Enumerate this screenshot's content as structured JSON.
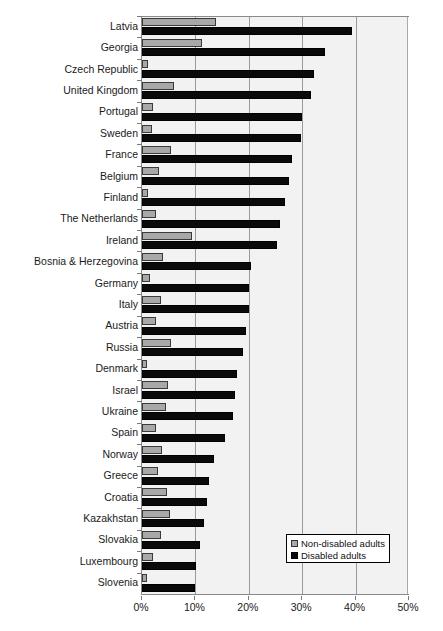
{
  "chart_data": {
    "type": "bar",
    "orientation": "horizontal",
    "title": "",
    "subtitle": "",
    "xlabel": "",
    "ylabel": "",
    "xlim": [
      0,
      50
    ],
    "xunit": "%",
    "xtick_labels": [
      "0%",
      "10%",
      "20%",
      "30%",
      "40%",
      "50%"
    ],
    "xticks": [
      0,
      10,
      20,
      30,
      40,
      50
    ],
    "grid": true,
    "grid_axis": "x",
    "legend_position": "bottom-right",
    "categories": [
      "Latvia",
      "Georgia",
      "Czech Republic",
      "United Kingdom",
      "Portugal",
      "Sweden",
      "France",
      "Belgium",
      "Finland",
      "The Netherlands",
      "Ireland",
      "Bosnia & Herzegovina",
      "Germany",
      "Italy",
      "Austria",
      "Russia",
      "Denmark",
      "Israel",
      "Ukraine",
      "Spain",
      "Norway",
      "Greece",
      "Croatia",
      "Kazakhstan",
      "Slovakia",
      "Luxembourg",
      "Slovenia"
    ],
    "series": [
      {
        "name": "Non-disabled adults",
        "color": "#a8a8a8",
        "values": [
          13.9,
          11.2,
          1.1,
          6.0,
          2.1,
          1.8,
          5.4,
          3.2,
          1.2,
          2.6,
          9.4,
          4.0,
          1.5,
          3.6,
          2.6,
          5.5,
          0.9,
          4.9,
          4.5,
          2.6,
          3.8,
          3.0,
          4.6,
          5.2,
          3.6,
          2.0,
          1.0
        ]
      },
      {
        "name": "Disabled adults",
        "color": "#0a0a0a",
        "values": [
          39.3,
          34.2,
          32.2,
          31.7,
          29.9,
          29.7,
          28.0,
          27.5,
          26.7,
          25.8,
          25.2,
          20.4,
          20.0,
          20.0,
          19.4,
          19.0,
          17.8,
          17.4,
          17.0,
          15.5,
          13.5,
          12.5,
          12.1,
          11.6,
          10.8,
          10.1,
          10.0
        ]
      }
    ]
  },
  "legend": {
    "items": [
      {
        "label": "Non-disabled adults",
        "swatch": "grey"
      },
      {
        "label": "Disabled adults",
        "swatch": "black"
      }
    ]
  }
}
